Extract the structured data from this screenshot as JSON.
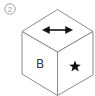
{
  "figure": {
    "label": "②",
    "label_number": 2,
    "object": "cube",
    "faces": {
      "top": {
        "symbol": "double-headed horizontal arrow",
        "icon": "double-arrow-icon"
      },
      "front_left": {
        "symbol": "letter",
        "text": "B"
      },
      "front_right": {
        "symbol": "filled star",
        "icon": "star-icon"
      }
    },
    "colors": {
      "edge": "#8a8a8a",
      "symbol": "#111111",
      "letter": "#3a3a3a",
      "label": "#9a9a9a",
      "background": "#ffffff"
    }
  }
}
